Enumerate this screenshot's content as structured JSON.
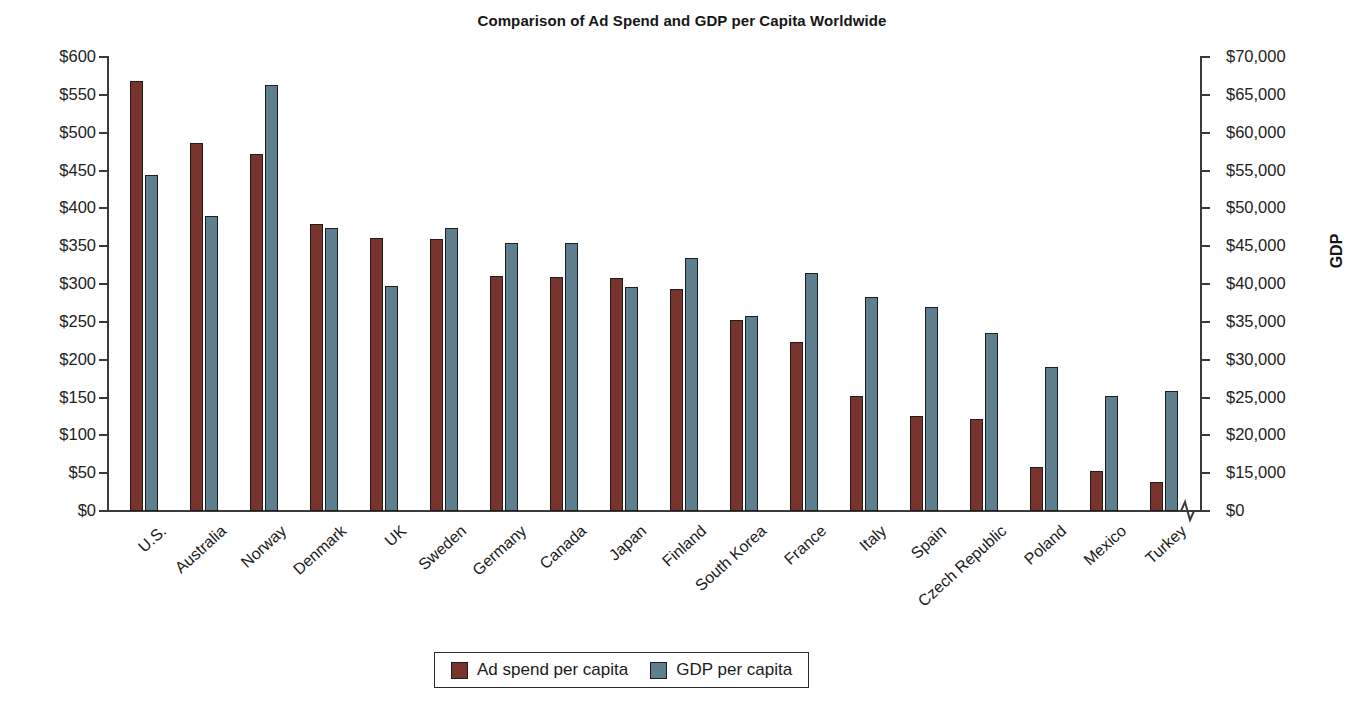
{
  "chart_data": {
    "type": "bar",
    "title": "Comparison of Ad Spend and GDP per Capita Worldwide",
    "xlabel": "",
    "ylabel": "Ad spend",
    "y2label": "GDP",
    "ylim": [
      0,
      600
    ],
    "y2lim": [
      0,
      70000
    ],
    "grid": false,
    "legend_position": "bottom",
    "axis_note": "right axis has a break between $0 and $15,000",
    "categories": [
      "U.S.",
      "Australia",
      "Norway",
      "Denmark",
      "UK",
      "Sweden",
      "Germany",
      "Canada",
      "Japan",
      "Finland",
      "South Korea",
      "France",
      "Italy",
      "Spain",
      "Czech Republic",
      "Poland",
      "Mexico",
      "Turkey"
    ],
    "series": [
      {
        "name": "Ad spend per capita",
        "color": "#78342c",
        "axis": "left",
        "values": [
          568,
          487,
          472,
          379,
          361,
          360,
          310,
          309,
          308,
          293,
          252,
          223,
          152,
          126,
          121,
          58,
          53,
          39
        ]
      },
      {
        "name": "GDP per capita",
        "color": "#5e7f90",
        "axis": "right",
        "values": [
          51800,
          45500,
          65700,
          43600,
          34700,
          43600,
          41300,
          41300,
          34500,
          39000,
          30100,
          36700,
          33000,
          31400,
          27400,
          22200,
          17800,
          18500
        ]
      }
    ],
    "y_ticks": [
      "$600",
      "$550",
      "$500",
      "$450",
      "$400",
      "$350",
      "$300",
      "$250",
      "$200",
      "$150",
      "$100",
      "$50",
      "$0"
    ],
    "y2_ticks": [
      "$70,000",
      "$65,000",
      "$60,000",
      "$55,000",
      "$50,000",
      "$45,000",
      "$40,000",
      "$35,000",
      "$30,000",
      "$25,000",
      "$20,000",
      "$15,000",
      "$0"
    ]
  },
  "legend": {
    "items": [
      {
        "label": "Ad spend per capita"
      },
      {
        "label": "GDP per capita"
      }
    ]
  }
}
